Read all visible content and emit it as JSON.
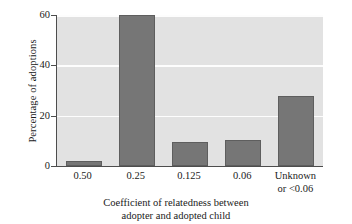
{
  "chart_data": {
    "type": "bar",
    "title": "",
    "subtitle": "",
    "xlabel": "Coefficient of relatedness between\nadopter and adopted child",
    "ylabel": "Percentage of adoptions",
    "categories": [
      "0.50",
      "0.25",
      "0.125",
      "0.06",
      "Unknown\nor <0.06"
    ],
    "values": [
      2,
      60,
      9.5,
      10.5,
      28
    ],
    "ylim": [
      0,
      60
    ],
    "yticks": [
      0,
      20,
      40,
      60
    ],
    "ytick_labels": [
      "0",
      "20",
      "40",
      "60"
    ],
    "grid": true,
    "grid_axis": "y",
    "legend": false,
    "legend_position": "none",
    "bar_color": "#767676",
    "bar_edge_color": "#5e5e5e",
    "plot_background": "#e2e2e2",
    "gridline_color": "#fdfdfd",
    "axis_color": "#4d4d4d",
    "figure_background": "#ffffff"
  }
}
